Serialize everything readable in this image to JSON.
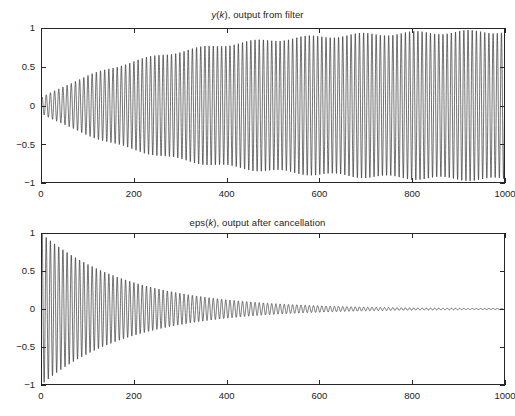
{
  "figure": {
    "background_color": "#ffffff",
    "axis_color": "#262626",
    "trace_color": "#1d1d1d"
  },
  "chart_data": [
    {
      "type": "line",
      "name": "filter-output",
      "title": "y(k), output from filter",
      "title_parts": [
        {
          "text": "y",
          "italic": true
        },
        {
          "text": "(",
          "italic": false
        },
        {
          "text": "k",
          "italic": true
        },
        {
          "text": "), output from filter",
          "italic": false
        }
      ],
      "xlabel": "",
      "ylabel": "",
      "xlim": [
        0,
        1000
      ],
      "ylim": [
        -1,
        1
      ],
      "xticks": [
        0,
        200,
        400,
        600,
        800,
        1000
      ],
      "xtick_labels": [
        "0",
        "200",
        "400",
        "600",
        "800",
        "1000"
      ],
      "yticks": [
        -1,
        -0.5,
        0,
        0.5,
        1
      ],
      "ytick_labels": [
        "-1",
        "-0.5",
        "0",
        "0.5",
        "1"
      ],
      "grid": false,
      "legend": null,
      "description": "Sinusoid whose envelope grows from about 0.1 at k=0 and saturates near 1.0 by k=700, with fast oscillation (period about 9 samples) producing a dense aliased band.",
      "signal_model": {
        "form": "A(k) * sin(2*pi*f*k + phase)",
        "frequency_cycles_per_sample": 0.1111,
        "phase_rad": 0.0,
        "envelope_form": "A(k) = a_final - (a_final - a_start) * exp(-k / tau)",
        "envelope_start": 0.1,
        "envelope_final": 1.0,
        "envelope_tau": 260,
        "secondary_modulation_depth": 0.05,
        "secondary_modulation_period_samples": 115,
        "samples": 1000
      }
    },
    {
      "type": "line",
      "name": "cancellation-error",
      "title": "eps(k), output after cancellation",
      "title_parts": [
        {
          "text": "eps(",
          "italic": false
        },
        {
          "text": "k",
          "italic": true
        },
        {
          "text": "), output after cancellation",
          "italic": false
        }
      ],
      "xlabel": "",
      "ylabel": "",
      "xlim": [
        0,
        1000
      ],
      "ylim": [
        -1,
        1
      ],
      "xticks": [
        0,
        200,
        400,
        600,
        800,
        1000
      ],
      "xtick_labels": [
        "0",
        "200",
        "400",
        "600",
        "800",
        "1000"
      ],
      "yticks": [
        -1,
        -0.5,
        0,
        0.5,
        1
      ],
      "ytick_labels": [
        "-1",
        "-0.5",
        "0",
        "0.5",
        "1"
      ],
      "grid": false,
      "legend": null,
      "description": "Sinusoid starting at amplitude 1.0 at k=0 and decaying exponentially, reaching roughly 0.08 by k=500 and essentially zero after k=800.",
      "signal_model": {
        "form": "A(k) * sin(2*pi*f*k + phase)",
        "frequency_cycles_per_sample": 0.1111,
        "phase_rad": 0.0,
        "envelope_form": "A(k) = a_start * exp(-k / tau)",
        "envelope_start": 1.0,
        "envelope_tau": 190,
        "samples": 1000
      }
    }
  ]
}
